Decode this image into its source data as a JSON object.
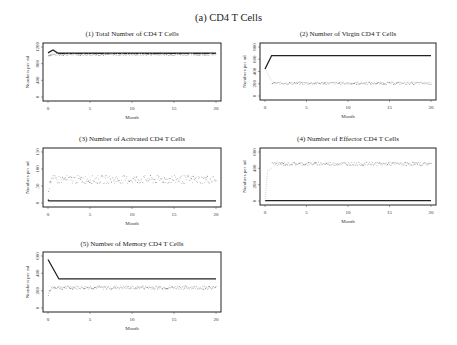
{
  "figure": {
    "title": "(a) CD4 T Cells"
  },
  "chart_data": [
    {
      "id": "p1",
      "type": "line",
      "title": "(1) Total Number of CD4 T Cells",
      "xlabel": "Month",
      "ylabel": "Numbers per ml",
      "xlim": [
        0,
        20
      ],
      "ylim": [
        0,
        1200
      ],
      "xticks": [
        0,
        5,
        10,
        15,
        20
      ],
      "yticks": [
        0,
        400,
        800,
        1200
      ],
      "grid": false,
      "series": [
        {
          "name": "model",
          "style": "solid",
          "x": [
            0,
            0.6,
            1.2,
            20
          ],
          "y": [
            1060,
            1130,
            1050,
            1050
          ]
        },
        {
          "name": "simulated",
          "style": "dotted",
          "mean": 1030,
          "spread": 25,
          "start": 1000
        }
      ]
    },
    {
      "id": "p2",
      "type": "line",
      "title": "(2) Number of Virgin CD4 T Cells",
      "xlabel": "Month",
      "ylabel": "Numbers per ml",
      "xlim": [
        0,
        20
      ],
      "ylim": [
        0,
        800
      ],
      "xticks": [
        0,
        5,
        10,
        15,
        20
      ],
      "yticks": [
        0,
        200,
        400,
        600,
        800
      ],
      "grid": false,
      "series": [
        {
          "name": "model",
          "style": "solid",
          "x": [
            0,
            0.8,
            20
          ],
          "y": [
            440,
            660,
            660
          ]
        },
        {
          "name": "simulated",
          "style": "dotted",
          "x0": [
            0,
            0.8
          ],
          "y0": [
            440,
            250
          ],
          "mean": 215,
          "spread": 20,
          "start": 440
        }
      ]
    },
    {
      "id": "p3",
      "type": "line",
      "title": "(3) Number of Activated CD4 T Cells",
      "xlabel": "Month",
      "ylabel": "Numbers per ml",
      "xlim": [
        0,
        20
      ],
      "ylim": [
        0,
        150
      ],
      "xticks": [
        0,
        5,
        10,
        15,
        20
      ],
      "yticks": [
        0,
        50,
        100,
        150
      ],
      "grid": false,
      "series": [
        {
          "name": "model",
          "style": "solid",
          "x": [
            0,
            0.1,
            20
          ],
          "y": [
            10,
            6,
            6
          ]
        },
        {
          "name": "simulated",
          "style": "dotted",
          "mean": 70,
          "spread": 12,
          "start": 40
        }
      ]
    },
    {
      "id": "p4",
      "type": "line",
      "title": "(4) Number of Effector CD4 T Cells",
      "xlabel": "Month",
      "ylabel": "Numbers per ml",
      "xlim": [
        0,
        20
      ],
      "ylim": [
        0,
        600
      ],
      "xticks": [
        0,
        5,
        10,
        15,
        20
      ],
      "yticks": [
        0,
        200,
        400,
        600
      ],
      "grid": false,
      "series": [
        {
          "name": "model",
          "style": "solid",
          "x": [
            0,
            20
          ],
          "y": [
            5,
            5
          ]
        },
        {
          "name": "simulated",
          "style": "dotted",
          "x0": [
            0,
            0.3,
            0.8
          ],
          "y0": [
            0,
            370,
            400
          ],
          "mean": 460,
          "spread": 20,
          "start": 0
        }
      ]
    },
    {
      "id": "p5",
      "type": "line",
      "title": "(5) Number of Memory CD4 T Cells",
      "xlabel": "Month",
      "ylabel": "Numbers per ml",
      "xlim": [
        0,
        20
      ],
      "ylim": [
        0,
        600
      ],
      "xticks": [
        0,
        5,
        10,
        15,
        20
      ],
      "yticks": [
        0,
        200,
        400,
        600
      ],
      "grid": false,
      "series": [
        {
          "name": "model",
          "style": "solid",
          "x": [
            0,
            1.3,
            20
          ],
          "y": [
            560,
            335,
            335
          ]
        },
        {
          "name": "simulated",
          "style": "dotted",
          "mean": 240,
          "spread": 20,
          "start": 160
        }
      ]
    }
  ]
}
